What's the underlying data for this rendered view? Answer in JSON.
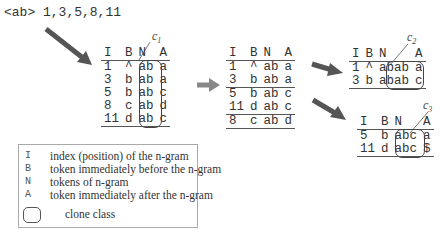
{
  "query": "<ab> 1,3,5,8,11",
  "colors": {
    "arrow": "#555555",
    "line": "#555555",
    "text": "#333333"
  },
  "headers": [
    "I",
    "B",
    "N",
    "A"
  ],
  "table1": {
    "rows": [
      [
        "1",
        "^",
        "ab",
        "a"
      ],
      [
        "3",
        "b",
        "ab",
        "a"
      ],
      [
        "5",
        "b",
        "ab",
        "c"
      ],
      [
        "8",
        "c",
        "ab",
        "d"
      ],
      [
        "11",
        "d",
        "ab",
        "c"
      ]
    ],
    "clone_label": "c",
    "clone_sub": "1"
  },
  "table2": {
    "rows": [
      [
        "1",
        "^",
        "ab",
        "a"
      ],
      [
        "3",
        "b",
        "ab",
        "a"
      ],
      [
        "5",
        "b",
        "ab",
        "c"
      ],
      [
        "11",
        "d",
        "ab",
        "c"
      ],
      [
        "8",
        "c",
        "ab",
        "d"
      ]
    ]
  },
  "table3": {
    "rows": [
      [
        "1",
        "^",
        "abab",
        "a"
      ],
      [
        "3",
        "b",
        "abab",
        "c"
      ]
    ],
    "clone_label": "c",
    "clone_sub": "2"
  },
  "table4": {
    "rows": [
      [
        "5",
        "b",
        "abc",
        "a"
      ],
      [
        "11",
        "d",
        "abc",
        "$"
      ]
    ],
    "clone_label": "c",
    "clone_sub": "3"
  },
  "legend": {
    "items": [
      {
        "key": "I",
        "desc": "index (position) of  the n-gram"
      },
      {
        "key": "B",
        "desc": "token immediately before the n-gram"
      },
      {
        "key": "N",
        "desc": "tokens of n-gram"
      },
      {
        "key": "A",
        "desc": "token immediately after the n-gram"
      }
    ],
    "clone_class_label": "clone class"
  }
}
